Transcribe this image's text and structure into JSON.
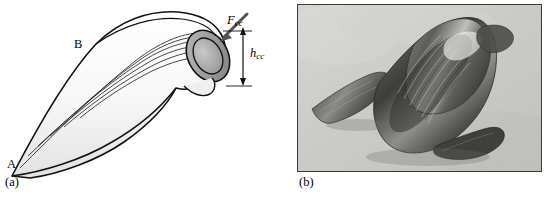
{
  "figure": {
    "panel_a": {
      "caption": "(a)",
      "labels": {
        "point_b": "B",
        "point_a": "A",
        "force": "F",
        "force_sub": "cc",
        "height": "h",
        "height_sub": "cc"
      },
      "icon_names": {
        "force_arrow": "force-arrow-icon",
        "height_dimension": "height-dimension-icon"
      }
    },
    "panel_b": {
      "caption": "(b)",
      "image_alt": "photograph-of-curled-chip"
    }
  }
}
